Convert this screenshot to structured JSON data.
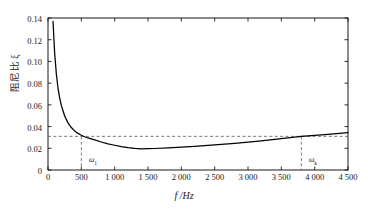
{
  "chart_data": {
    "type": "line",
    "title": "",
    "xlabel": "f /Hz",
    "ylabel": "阻尼比 ξ",
    "xlim": [
      0,
      4500
    ],
    "ylim": [
      0,
      0.14
    ],
    "grid": false,
    "legend": null,
    "xticks": [
      "0",
      "500",
      "1 000",
      "1 500",
      "2 000",
      "2 500",
      "3 000",
      "3 500",
      "4 000",
      "4 500"
    ],
    "xtick_values": [
      0,
      500,
      1000,
      1500,
      2000,
      2500,
      3000,
      3500,
      4000,
      4500
    ],
    "yticks": [
      "0",
      "0.02",
      "0.04",
      "0.06",
      "0.08",
      "0.10",
      "0.12",
      "0.14"
    ],
    "ytick_values": [
      0,
      0.02,
      0.04,
      0.06,
      0.08,
      0.1,
      0.12,
      0.14
    ],
    "series": [
      {
        "name": "damping ratio curve",
        "color": "#000000",
        "x": [
          75,
          100,
          125,
          150,
          175,
          200,
          250,
          300,
          350,
          400,
          450,
          500,
          550,
          600,
          700,
          800,
          900,
          1000,
          1100,
          1200,
          1300,
          1400,
          1500,
          1600,
          1800,
          2000,
          2200,
          2400,
          2600,
          2800,
          3000,
          3200,
          3400,
          3600,
          3800,
          4000,
          4200,
          4500
        ],
        "y": [
          0.137,
          0.1075,
          0.0885,
          0.0755,
          0.0665,
          0.0595,
          0.0497,
          0.0434,
          0.0391,
          0.036,
          0.0337,
          0.032,
          0.0306,
          0.0295,
          0.0277,
          0.0258,
          0.024,
          0.0228,
          0.0215,
          0.0205,
          0.0199,
          0.0195,
          0.0196,
          0.0198,
          0.0203,
          0.021,
          0.0218,
          0.0226,
          0.0235,
          0.0245,
          0.0256,
          0.0268,
          0.0281,
          0.0295,
          0.031,
          0.032,
          0.0329,
          0.0345
        ]
      }
    ],
    "reference_lines": [
      {
        "name": "threshold-line",
        "orientation": "horizontal",
        "value": 0.031,
        "style": "dashed"
      },
      {
        "name": "omega-1-line",
        "orientation": "vertical",
        "value": 500,
        "style": "dashed",
        "from": 0,
        "to": 0.031
      },
      {
        "name": "omega-k-line",
        "orientation": "vertical",
        "value": 3800,
        "style": "dashed",
        "from": 0,
        "to": 0.031
      }
    ],
    "annotations": [
      {
        "name": "omega-1-label",
        "text": "ω",
        "sub": "1",
        "x": 620,
        "y": 0.0045
      },
      {
        "name": "omega-k-label",
        "text": "ω",
        "sub": "k",
        "x": 3920,
        "y": 0.0045
      }
    ]
  },
  "axes": {
    "frame_color": "#000000",
    "dash_color": "#555555"
  }
}
